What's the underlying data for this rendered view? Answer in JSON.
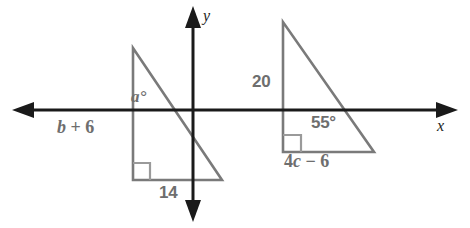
{
  "figure": {
    "background_color": "#ffffff",
    "axis_color": "#1a1a1a",
    "shape_color": "#7a7a7a",
    "label_color": "#6e6e6e",
    "axes": {
      "x_label": "x",
      "y_label": "y",
      "x_arrow_left": true,
      "x_arrow_right": true,
      "y_arrow_up": true,
      "y_arrow_down": true
    },
    "labels": {
      "left_angle": "a°",
      "left_vertical_leg": "b + 6",
      "left_vertical_leg_coef": "b",
      "left_vertical_leg_rest": " + 6",
      "left_base": "14",
      "right_vertical_leg": "20",
      "right_angle_measure": "55°",
      "right_base": "4c − 6",
      "right_base_pre": "4",
      "right_base_var": "c",
      "right_base_post": " − 6"
    },
    "shapes": [
      {
        "name": "left-triangle",
        "right_angle_marker": "bottom-left",
        "vertices": [
          [
            133,
            48
          ],
          [
            133,
            180
          ],
          [
            222,
            180
          ]
        ]
      },
      {
        "name": "right-triangle",
        "right_angle_marker": "bottom-left",
        "vertices": [
          [
            283,
            22
          ],
          [
            283,
            152
          ],
          [
            374,
            152
          ]
        ]
      }
    ]
  }
}
